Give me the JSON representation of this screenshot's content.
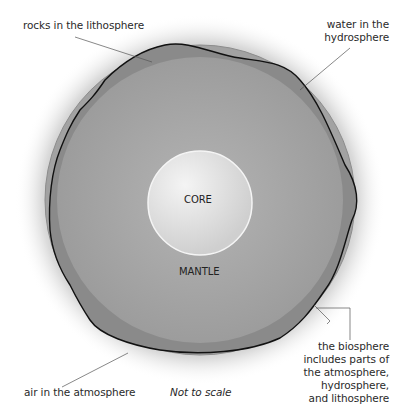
{
  "diagram": {
    "labels": {
      "rocks": "rocks in the lithosphere",
      "water": [
        "water in the",
        "hydrosphere"
      ],
      "biosphere": [
        "the biosphere",
        "includes parts of",
        "the atmosphere,",
        "hydrosphere,",
        "and lithosphere"
      ],
      "air": "air in the atmosphere",
      "scale_note": "Not to scale",
      "core": "CORE",
      "mantle": "MANTLE"
    },
    "colors": {
      "atmosphere_glow": "#d9d9d9",
      "hydrosphere": "#9a9a9a",
      "lithosphere": "#7f7f7f",
      "mantle": "#a6a6a6",
      "core": "#e4e4e4",
      "outline": "#111111",
      "leader_line": "#555555"
    }
  }
}
